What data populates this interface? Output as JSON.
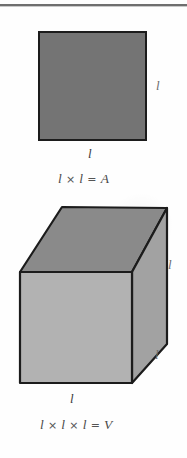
{
  "figure": {
    "background_color": "#fefefe",
    "divider": {
      "name": "top-horizontal-rule",
      "color": "#6e6e6e"
    }
  },
  "square_figure": {
    "name": "square-diagram",
    "fill_color": "#747474",
    "stroke_color": "#1c1c1c",
    "labels": {
      "right_side": "l",
      "bottom_side": "l"
    },
    "formula": {
      "left_operand": "l",
      "operator": "×",
      "right_operand": "l",
      "equals": "=",
      "result": "A",
      "full_text": "l × l = A"
    }
  },
  "cube_figure": {
    "name": "cube-diagram",
    "top_face_color": "#8a8a8a",
    "front_face_color": "#b2b2b2",
    "right_face_color": "#a2a2a2",
    "stroke_color": "#1c1c1c",
    "labels": {
      "vertical_edge": "l",
      "depth_edge": "l",
      "bottom_edge": "l"
    },
    "formula": {
      "operand_1": "l",
      "operator_1": "×",
      "operand_2": "l",
      "operator_2": "×",
      "operand_3": "l",
      "equals": "=",
      "result": "V",
      "full_text": "l × l × l = V"
    }
  }
}
